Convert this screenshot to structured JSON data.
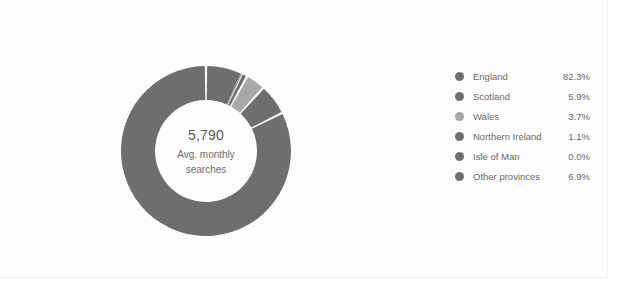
{
  "chart_data": {
    "type": "pie",
    "variant": "donut",
    "title": "",
    "center_value": "5,790",
    "center_subtitle_line1": "Avg. monthly",
    "center_subtitle_line2": "searches",
    "legend_position": "right",
    "start_angle_deg": 0,
    "direction": "counterclockwise",
    "categories": [
      "England",
      "Scotland",
      "Wales",
      "Northern Ireland",
      "Isle of Man",
      "Other provinces"
    ],
    "values": [
      82.3,
      5.9,
      3.7,
      1.1,
      0.0,
      6.9
    ],
    "value_labels": [
      "82.3%",
      "5.9%",
      "3.7%",
      "1.1%",
      "0.0%",
      "6.9%"
    ],
    "colors": [
      "#6e6e6e",
      "#6e6e6e",
      "#a8a8a8",
      "#6e6e6e",
      "#6e6e6e",
      "#6e6e6e"
    ]
  },
  "legend": {
    "rows": [
      {
        "label": "England",
        "value": "82.3%",
        "color": "#6e6e6e"
      },
      {
        "label": "Scotland",
        "value": "5.9%",
        "color": "#6e6e6e"
      },
      {
        "label": "Wales",
        "value": "3.7%",
        "color": "#a8a8a8"
      },
      {
        "label": "Northern Ireland",
        "value": "1.1%",
        "color": "#6e6e6e"
      },
      {
        "label": "Isle of Man",
        "value": "0.0%",
        "color": "#6e6e6e"
      },
      {
        "label": "Other provinces",
        "value": "6.9%",
        "color": "#6e6e6e"
      }
    ]
  },
  "style": {
    "card_background": "#fcfcfd",
    "segment_gap_color": "#fcfcfd",
    "hole_color": "#fcfcfd"
  }
}
